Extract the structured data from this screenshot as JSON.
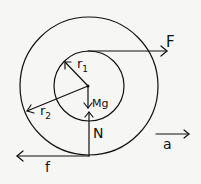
{
  "diagram": {
    "labels": {
      "force_applied": "F",
      "inner_radius": "r",
      "inner_radius_sub": "1",
      "outer_radius": "r",
      "outer_radius_sub": "2",
      "weight": "Mg",
      "normal": "N",
      "friction": "f",
      "acceleration": "a"
    },
    "geometry": {
      "center": [
        89,
        86
      ],
      "inner_radius_px": 35,
      "outer_radius_px": 69
    },
    "colors": {
      "stroke": "#111111",
      "background": "#f6f6f4"
    }
  }
}
